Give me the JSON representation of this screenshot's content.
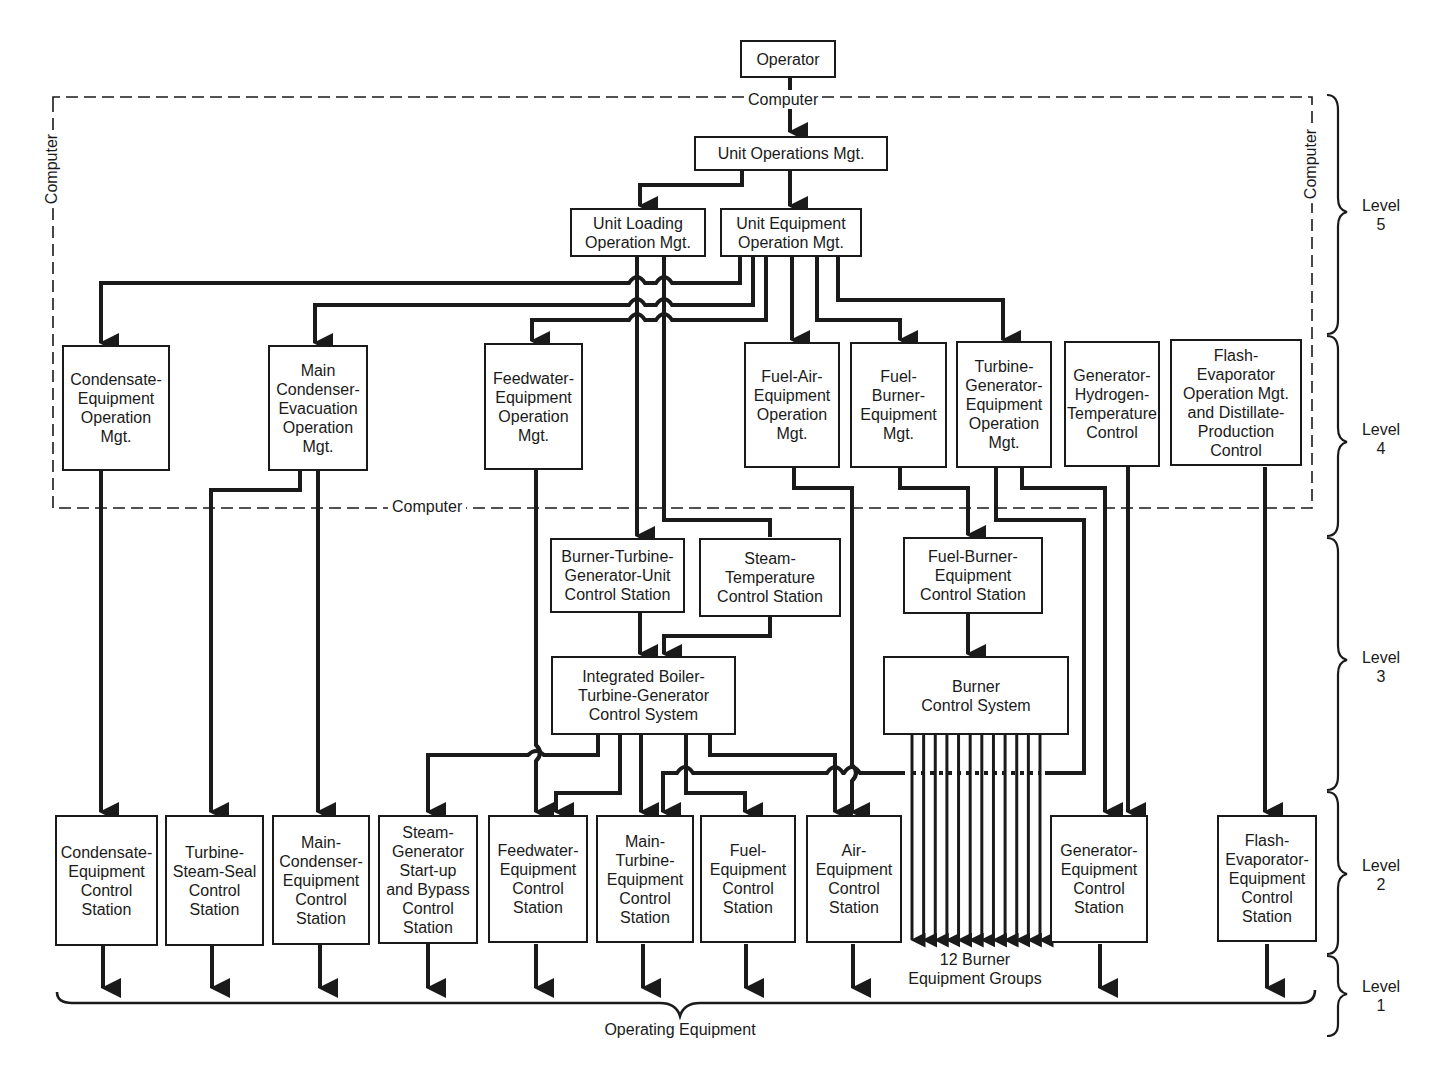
{
  "diagram": {
    "top": {
      "operator": "Operator",
      "unit_operations": "Unit Operations Mgt.",
      "unit_loading": "Unit  Loading\nOperation  Mgt.",
      "unit_equipment": "Unit  Equipment\nOperation  Mgt."
    },
    "computer_labels": {
      "top": "Computer",
      "bottom": "Computer",
      "left": "Computer",
      "right": "Computer"
    },
    "level4": [
      {
        "id": "condensate-op",
        "label": "Condensate-\nEquipment\nOperation\nMgt."
      },
      {
        "id": "main-condenser-op",
        "label": "Main\nCondenser-\nEvacuation\nOperation\nMgt."
      },
      {
        "id": "feedwater-op",
        "label": "Feedwater-\nEquipment\nOperation\nMgt."
      },
      {
        "id": "fuel-air-op",
        "label": "Fuel-Air-\nEquipment\nOperation\nMgt."
      },
      {
        "id": "fuel-burner-op",
        "label": "Fuel-\nBurner-\nEquipment\nMgt."
      },
      {
        "id": "turbine-generator-op",
        "label": "Turbine-\nGenerator-\nEquipment\nOperation\nMgt."
      },
      {
        "id": "generator-hydrogen",
        "label": "Generator-\nHydrogen-\nTemperature\nControl"
      },
      {
        "id": "flash-evaporator-op",
        "label": "Flash-\nEvaporator\nOperation Mgt.\nand Distillate-\nProduction\nControl"
      }
    ],
    "level3": {
      "burner_turbine_station": "Burner-Turbine-\nGenerator-Unit\nControl Station",
      "steam_temperature_station": "Steam-\nTemperature\nControl Station",
      "fuel_burner_station": "Fuel-Burner-\nEquipment\nControl Station",
      "integrated_system": "Integrated Boiler-\nTurbine-Generator\nControl  System",
      "burner_control_system": "Burner\nControl  System"
    },
    "level2": [
      {
        "id": "condensate-station",
        "label": "Condensate-\nEquipment\nControl\nStation"
      },
      {
        "id": "turbine-steam-seal",
        "label": "Turbine-\nSteam-Seal\nControl\nStation"
      },
      {
        "id": "main-condenser-station",
        "label": "Main-\nCondenser-\nEquipment\nControl\nStation"
      },
      {
        "id": "steam-generator-startup",
        "label": "Steam-\nGenerator\nStart-up\nand Bypass\nControl\nStation"
      },
      {
        "id": "feedwater-station",
        "label": "Feedwater-\nEquipment\nControl\nStation"
      },
      {
        "id": "main-turbine-station",
        "label": "Main-\nTurbine-\nEquipment\nControl\nStation"
      },
      {
        "id": "fuel-station",
        "label": "Fuel-\nEquipment\nControl\nStation"
      },
      {
        "id": "air-station",
        "label": "Air-\nEquipment\nControl\nStation"
      },
      {
        "id": "generator-station",
        "label": "Generator-\nEquipment\nControl\nStation"
      },
      {
        "id": "flash-evaporator-station",
        "label": "Flash-\nEvaporator-\nEquipment\nControl\nStation"
      }
    ],
    "burner_groups": "12 Burner\nEquipment  Groups",
    "burner_group_count": 12,
    "operating_equipment": "Operating Equipment",
    "levels": [
      {
        "label": "Level\n5"
      },
      {
        "label": "Level\n4"
      },
      {
        "label": "Level\n3"
      },
      {
        "label": "Level\n2"
      },
      {
        "label": "Level\n1"
      }
    ]
  }
}
